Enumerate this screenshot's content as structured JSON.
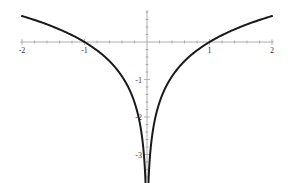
{
  "chart_data": {
    "type": "line",
    "title": "",
    "function": "y = ln|x|",
    "xlabel": "",
    "ylabel": "",
    "xlim": [
      -2,
      2
    ],
    "ylim": [
      -3.6,
      0.8
    ],
    "grid": false,
    "legend": null,
    "x_ticks": [
      -2,
      -1,
      1,
      2
    ],
    "x_tick_labels": [
      "-2",
      "-1",
      "1",
      "2"
    ],
    "y_ticks": [
      -1,
      -2,
      -3
    ],
    "y_tick_labels": [
      "-1",
      "-2",
      "-3"
    ],
    "minor_tick_step": 0.2,
    "series": [
      {
        "name": "ln|x| (x<0)",
        "x": [
          -2,
          -1.75,
          -1.5,
          -1.25,
          -1,
          -0.75,
          -0.5,
          -0.35,
          -0.25,
          -0.15,
          -0.1,
          -0.06,
          -0.04,
          -0.03
        ],
        "values": [
          0.693,
          0.56,
          0.405,
          0.223,
          0,
          -0.288,
          -0.693,
          -1.05,
          -1.386,
          -1.897,
          -2.303,
          -2.813,
          -3.219,
          -3.507
        ]
      },
      {
        "name": "ln|x| (x>0)",
        "x": [
          0.03,
          0.04,
          0.06,
          0.1,
          0.15,
          0.25,
          0.35,
          0.5,
          0.75,
          1,
          1.25,
          1.5,
          1.75,
          2
        ],
        "values": [
          -3.507,
          -3.219,
          -2.813,
          -2.303,
          -1.897,
          -1.386,
          -1.05,
          -0.693,
          -0.288,
          0,
          0.223,
          0.405,
          0.56,
          0.693
        ]
      }
    ],
    "colors": {
      "curve": "#1a1a1a",
      "axis": "#999999",
      "label": "#333333"
    }
  }
}
